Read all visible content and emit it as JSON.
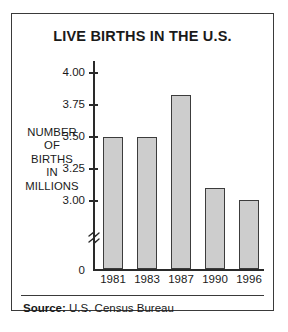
{
  "chart_data": {
    "type": "bar",
    "title": "LIVE BIRTHS IN THE U.S.",
    "categories": [
      "1981",
      "1983",
      "1987",
      "1990",
      "1996"
    ],
    "values": [
      3.5,
      3.5,
      3.83,
      3.1,
      3.01
    ],
    "xlabel": "",
    "ylabel": "NUMBER OF BIRTHS IN MILLIONS",
    "ylabel_lines": [
      "NUMBER",
      "OF",
      "BIRTHS",
      "IN",
      "MILLIONS"
    ],
    "ylim": [
      3.0,
      4.0
    ],
    "yticks": [
      "4.00",
      "3.75",
      "3.50",
      "3.25",
      "3.00"
    ],
    "ytick_values": [
      4.0,
      3.75,
      3.5,
      3.25,
      3.0
    ],
    "axis_origin_label": "0",
    "axis_break": true,
    "axis_break_symbol": "≈",
    "grid": false,
    "legend": null,
    "bar_fill_color": "#cdcdcd",
    "bar_border_color": "#3c3c3c",
    "axis_color": "#2a2a2a"
  },
  "source": {
    "label": "Source:",
    "value": "U.S. Census Bureau"
  }
}
